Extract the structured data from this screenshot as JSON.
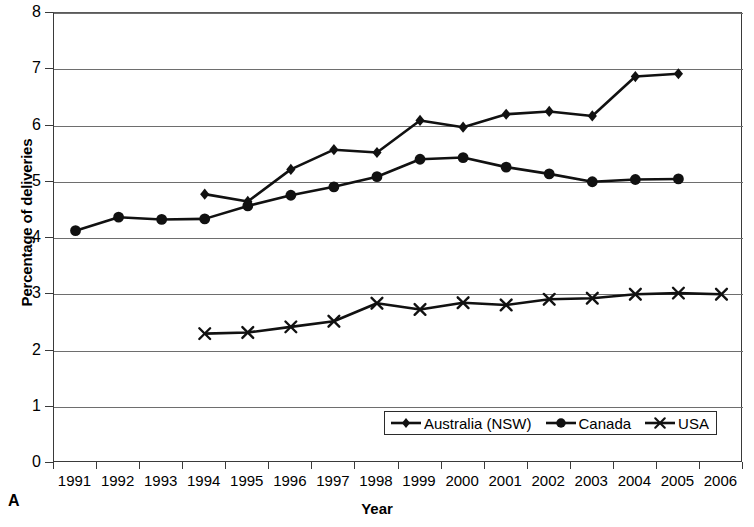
{
  "chart_data": {
    "type": "line",
    "title": "",
    "panel_label": "A",
    "xlabel": "Year",
    "ylabel": "Percentage of deliveries",
    "grid": true,
    "legend_position": "bottom-right-inside",
    "xlim": [
      1991,
      2006
    ],
    "ylim": [
      0,
      8
    ],
    "yticks": [
      0,
      1,
      2,
      3,
      4,
      5,
      6,
      7,
      8
    ],
    "categories": [
      1991,
      1992,
      1993,
      1994,
      1995,
      1996,
      1997,
      1998,
      1999,
      2000,
      2001,
      2002,
      2003,
      2004,
      2005,
      2006
    ],
    "xticklabels": [
      "1991",
      "1992",
      "1993",
      "1994",
      "1995",
      "1996",
      "1997",
      "1998",
      "1999",
      "2000",
      "2001",
      "2002",
      "2003",
      "2004",
      "2005",
      "2006"
    ],
    "series": [
      {
        "name": "Australia (NSW)",
        "marker": "diamond",
        "color": "#111111",
        "x": [
          1994,
          1995,
          1996,
          1997,
          1998,
          1999,
          2000,
          2001,
          2002,
          2003,
          2004,
          2005
        ],
        "values": [
          4.78,
          4.65,
          5.22,
          5.57,
          5.52,
          6.09,
          5.97,
          6.2,
          6.25,
          6.17,
          6.87,
          6.92
        ]
      },
      {
        "name": "Canada",
        "marker": "circle",
        "color": "#111111",
        "x": [
          1991,
          1992,
          1993,
          1994,
          1995,
          1996,
          1997,
          1998,
          1999,
          2000,
          2001,
          2002,
          2003,
          2004,
          2005
        ],
        "values": [
          4.13,
          4.37,
          4.33,
          4.34,
          4.57,
          4.76,
          4.91,
          5.09,
          5.4,
          5.43,
          5.26,
          5.14,
          5.0,
          5.04,
          5.05
        ]
      },
      {
        "name": "USA",
        "marker": "x",
        "color": "#111111",
        "x": [
          1994,
          1995,
          1996,
          1997,
          1998,
          1999,
          2000,
          2001,
          2002,
          2003,
          2004,
          2005,
          2006
        ],
        "values": [
          2.3,
          2.32,
          2.42,
          2.52,
          2.84,
          2.73,
          2.85,
          2.81,
          2.91,
          2.93,
          3.0,
          3.02,
          3.0
        ]
      }
    ]
  }
}
